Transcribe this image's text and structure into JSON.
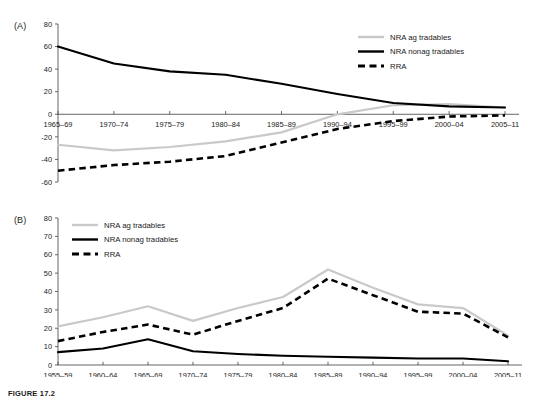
{
  "figure": {
    "caption": "FIGURE 17.2",
    "panels": [
      {
        "id": "A",
        "label": "(A)"
      },
      {
        "id": "B",
        "label": "(B)"
      }
    ]
  },
  "legend": {
    "series_names": [
      "NRA ag tradables",
      "NRA nonag tradables",
      "RRA"
    ],
    "colors": [
      "#c9c9c9",
      "#000000",
      "#000000"
    ],
    "styles": [
      "solid",
      "solid",
      "dashed"
    ]
  },
  "chart_data": [
    {
      "type": "line",
      "panel": "A",
      "title": "",
      "xlabel": "",
      "ylabel": "",
      "categories": [
        "1965–69",
        "1970–74",
        "1975–79",
        "1980–84",
        "1985–89",
        "1990–94",
        "1995–99",
        "2000–04",
        "2005–11"
      ],
      "ylim": [
        -60,
        80
      ],
      "yticks": [
        -60,
        -40,
        -20,
        0,
        20,
        40,
        60,
        80
      ],
      "grid": false,
      "legend_position": "top-right",
      "series": [
        {
          "name": "NRA ag tradables",
          "color": "#c9c9c9",
          "style": "solid",
          "values": [
            -27,
            -32,
            -29,
            -24,
            -16,
            0,
            8,
            9,
            6
          ]
        },
        {
          "name": "NRA nonag tradables",
          "color": "#000000",
          "style": "solid",
          "values": [
            60,
            45,
            38,
            35,
            27,
            18,
            10,
            7,
            6
          ]
        },
        {
          "name": "RRA",
          "color": "#000000",
          "style": "dashed",
          "values": [
            -50,
            -45,
            -42,
            -37,
            -25,
            -13,
            -6,
            -2,
            -1
          ]
        }
      ]
    },
    {
      "type": "line",
      "panel": "B",
      "title": "",
      "xlabel": "",
      "ylabel": "",
      "categories": [
        "1955–59",
        "1960–64",
        "1965–69",
        "1970–74",
        "1975–79",
        "1980–84",
        "1985–89",
        "1990–94",
        "1995–99",
        "2000–04",
        "2005–11"
      ],
      "ylim": [
        0,
        80
      ],
      "yticks": [
        0,
        10,
        20,
        30,
        40,
        50,
        60,
        70,
        80
      ],
      "grid": false,
      "legend_position": "top-left",
      "series": [
        {
          "name": "NRA ag tradables",
          "color": "#c9c9c9",
          "style": "solid",
          "values": [
            21,
            26,
            32,
            24,
            31,
            37,
            52,
            42,
            33,
            31,
            16
          ]
        },
        {
          "name": "NRA nonag tradables",
          "color": "#000000",
          "style": "solid",
          "values": [
            7,
            9,
            14,
            7.5,
            6,
            5,
            4.5,
            4,
            3.5,
            3.5,
            2
          ]
        },
        {
          "name": "RRA",
          "color": "#000000",
          "style": "dashed",
          "values": [
            13,
            18,
            22,
            16.5,
            24,
            31,
            47,
            38,
            29,
            28,
            15
          ]
        }
      ]
    }
  ]
}
